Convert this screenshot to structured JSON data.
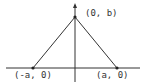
{
  "diagram": {
    "type": "triangle-on-axes",
    "points": {
      "top": {
        "label": "(0, b)",
        "x": 75,
        "y": 17
      },
      "left": {
        "label": "(-a, 0)",
        "x": 33,
        "y": 68
      },
      "right": {
        "label": "(a, 0)",
        "x": 117,
        "y": 68
      }
    },
    "axes": {
      "x_axis": {
        "y": 68,
        "x1": 6,
        "x2": 140
      },
      "y_axis": {
        "x": 75,
        "y1": 5,
        "y2": 82
      }
    },
    "colors": {
      "stroke": "#333333",
      "background": "#ffffff"
    }
  }
}
